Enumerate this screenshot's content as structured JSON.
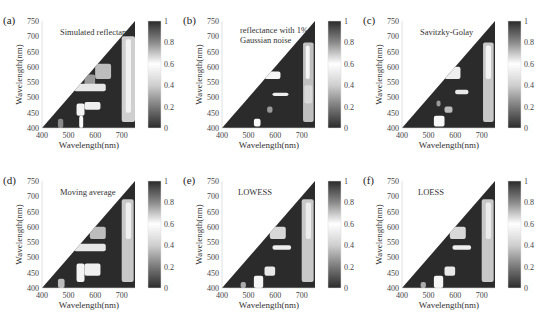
{
  "figure": {
    "colorbar": {
      "min": 0,
      "max": 1,
      "ticks": [
        "0",
        "0.2",
        "0.4",
        "0.6",
        "0.8",
        "1"
      ],
      "colormap": "gray (0=dark, 0.6=white, 1=dark)"
    },
    "xlabel": "Wavelength(nm)",
    "ylabel": "Wavelength(nm)",
    "xticks": [
      "400",
      "500",
      "600",
      "700"
    ],
    "yticks": [
      "400",
      "450",
      "500",
      "550",
      "600",
      "650",
      "700",
      "750"
    ]
  },
  "panels": [
    {
      "id": "a",
      "tag": "(a)",
      "title": "Simulated reflectance",
      "title2": ""
    },
    {
      "id": "b",
      "tag": "(b)",
      "title": "reflectance with 1%",
      "title2": "Gaussian noise"
    },
    {
      "id": "c",
      "tag": "(c)",
      "title": "Savitzky-Golay",
      "title2": ""
    },
    {
      "id": "d",
      "tag": "(d)",
      "title": "Moving average",
      "title2": ""
    },
    {
      "id": "e",
      "tag": "(e)",
      "title": "LOWESS",
      "title2": ""
    },
    {
      "id": "f",
      "tag": "(f)",
      "title": "LOESS",
      "title2": ""
    }
  ],
  "chart_data": [
    {
      "type": "heatmap",
      "title": "Simulated reflectance",
      "panel": "(a)",
      "xlabel": "Wavelength(nm)",
      "ylabel": "Wavelength(nm)",
      "xlim": [
        400,
        750
      ],
      "ylim": [
        400,
        750
      ],
      "xticks": [
        400,
        500,
        600,
        700
      ],
      "yticks": [
        400,
        450,
        500,
        550,
        600,
        650,
        700,
        750
      ],
      "colorbar": {
        "range": [
          0,
          1
        ],
        "ticks": [
          0,
          0.2,
          0.4,
          0.6,
          0.8,
          1
        ]
      },
      "mask": "lower triangle (y<=x)"
    },
    {
      "type": "heatmap",
      "title": "reflectance with 1% Gaussian noise",
      "panel": "(b)",
      "xlabel": "Wavelength(nm)",
      "ylabel": "Wavelength(nm)",
      "xlim": [
        400,
        750
      ],
      "ylim": [
        400,
        750
      ],
      "xticks": [
        400,
        500,
        600,
        700
      ],
      "yticks": [
        400,
        450,
        500,
        550,
        600,
        650,
        700,
        750
      ],
      "colorbar": {
        "range": [
          0,
          1
        ],
        "ticks": [
          0,
          0.2,
          0.4,
          0.6,
          0.8,
          1
        ]
      },
      "mask": "lower triangle (y<=x)"
    },
    {
      "type": "heatmap",
      "title": "Savitzky-Golay",
      "panel": "(c)",
      "xlabel": "Wavelength(nm)",
      "ylabel": "Wavelength(nm)",
      "xlim": [
        400,
        750
      ],
      "ylim": [
        400,
        750
      ],
      "xticks": [
        400,
        500,
        600,
        700
      ],
      "yticks": [
        400,
        450,
        500,
        550,
        600,
        650,
        700,
        750
      ],
      "colorbar": {
        "range": [
          0,
          1
        ],
        "ticks": [
          0,
          0.2,
          0.4,
          0.6,
          0.8,
          1
        ]
      },
      "mask": "lower triangle (y<=x)"
    },
    {
      "type": "heatmap",
      "title": "Moving average",
      "panel": "(d)",
      "xlabel": "Wavelength(nm)",
      "ylabel": "Wavelength(nm)",
      "xlim": [
        400,
        750
      ],
      "ylim": [
        400,
        750
      ],
      "xticks": [
        400,
        500,
        600,
        700
      ],
      "yticks": [
        400,
        450,
        500,
        550,
        600,
        650,
        700,
        750
      ],
      "colorbar": {
        "range": [
          0,
          1
        ],
        "ticks": [
          0,
          0.2,
          0.4,
          0.6,
          0.8,
          1
        ]
      },
      "mask": "lower triangle (y<=x)"
    },
    {
      "type": "heatmap",
      "title": "LOWESS",
      "panel": "(e)",
      "xlabel": "Wavelength(nm)",
      "ylabel": "Wavelength(nm)",
      "xlim": [
        400,
        750
      ],
      "ylim": [
        400,
        750
      ],
      "xticks": [
        400,
        500,
        600,
        700
      ],
      "yticks": [
        400,
        450,
        500,
        550,
        600,
        650,
        700,
        750
      ],
      "colorbar": {
        "range": [
          0,
          1
        ],
        "ticks": [
          0,
          0.2,
          0.4,
          0.6,
          0.8,
          1
        ]
      },
      "mask": "lower triangle (y<=x)"
    },
    {
      "type": "heatmap",
      "title": "LOESS",
      "panel": "(f)",
      "xlabel": "Wavelength(nm)",
      "ylabel": "Wavelength(nm)",
      "xlim": [
        400,
        750
      ],
      "ylim": [
        400,
        750
      ],
      "xticks": [
        400,
        500,
        600,
        700
      ],
      "yticks": [
        400,
        450,
        500,
        550,
        600,
        650,
        700,
        750
      ],
      "colorbar": {
        "range": [
          0,
          1
        ],
        "ticks": [
          0,
          0.2,
          0.4,
          0.6,
          0.8,
          1
        ]
      },
      "mask": "lower triangle (y<=x)"
    }
  ]
}
